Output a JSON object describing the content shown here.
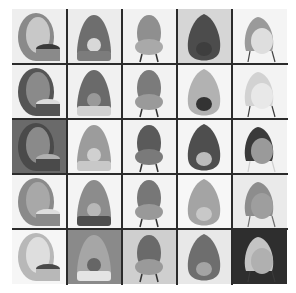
{
  "figure": {
    "type": "image-grid",
    "rows": 5,
    "cols": 5,
    "cells": [
      {
        "row": 1,
        "col": 1,
        "label": "tall egg chair with dark seat cushion",
        "bg": "#eeeeee",
        "shell": "#8a8a8a",
        "inner": "#c8c8c8",
        "accent": "#3a3a3a"
      },
      {
        "row": 1,
        "col": 2,
        "label": "avocado chair with round pit cushion",
        "bg": "#ececec",
        "shell": "#6e6e6e",
        "inner": "#7c7c7c",
        "accent": "#d8d8d8"
      },
      {
        "row": 1,
        "col": 3,
        "label": "bulbous chair with round seat on legs",
        "bg": "#f2f2f2",
        "shell": "#8f8f8f",
        "inner": "#a9a9a9",
        "accent": "#c4c4c4"
      },
      {
        "row": 1,
        "col": 4,
        "label": "dark teardrop chair with pit",
        "bg": "#d6d6d6",
        "shell": "#4c4c4c",
        "inner": "#5e5e5e",
        "accent": "#3e3e3e"
      },
      {
        "row": 1,
        "col": 5,
        "label": "pear chair with light cushion on metal legs",
        "bg": "#f4f4f4",
        "shell": "#9a9a9a",
        "inner": "#dedede",
        "accent": "#444444"
      },
      {
        "row": 2,
        "col": 1,
        "label": "ring pod chair on swivel base",
        "bg": "#f0f0f0",
        "shell": "#555555",
        "inner": "#8a8a8a",
        "accent": "#dcdcdc"
      },
      {
        "row": 2,
        "col": 2,
        "label": "reclined lounge pod, side view",
        "bg": "#f1f1f1",
        "shell": "#6a6a6a",
        "inner": "#d0d0d0",
        "accent": "#999999"
      },
      {
        "row": 2,
        "col": 3,
        "label": "avocado chair with oval seat",
        "bg": "#f2f2f2",
        "shell": "#7b7b7b",
        "inner": "#9a9a9a",
        "accent": "#e0e0e0"
      },
      {
        "row": 2,
        "col": 4,
        "label": "small avocado chair on casters",
        "bg": "#f5f5f5",
        "shell": "#b2b2b2",
        "inner": "#8c8c8c",
        "accent": "#333333"
      },
      {
        "row": 2,
        "col": 5,
        "label": "outlined pear chair with square cushion",
        "bg": "#f3f3f3",
        "shell": "#d2d2d2",
        "inner": "#e8e8e8",
        "accent": "#3a3a3a"
      },
      {
        "row": 3,
        "col": 1,
        "label": "lounge chair in living room scene",
        "bg": "#6a6a6a",
        "shell": "#4a4a4a",
        "inner": "#8a8a8a",
        "accent": "#b0b0b0"
      },
      {
        "row": 3,
        "col": 2,
        "label": "tilted egg bowl chair on pedestal",
        "bg": "#f5f5f5",
        "shell": "#9c9c9c",
        "inner": "#c8c8c8",
        "accent": "#d0d0d0"
      },
      {
        "row": 3,
        "col": 3,
        "label": "dark pointed egg chair",
        "bg": "#f2f2f2",
        "shell": "#5a5a5a",
        "inner": "#7a7a7a",
        "accent": "#a0a0a0"
      },
      {
        "row": 3,
        "col": 4,
        "label": "reclined pod with white cushion",
        "bg": "#f5f5f5",
        "shell": "#4e4e4e",
        "inner": "#e6e6e6",
        "accent": "#bcbcbc"
      },
      {
        "row": 3,
        "col": 5,
        "label": "black bowl chair with fruit seat",
        "bg": "#f2f2f2",
        "shell": "#3a3a3a",
        "inner": "#9a9a9a",
        "accent": "#cfcfcf"
      },
      {
        "row": 4,
        "col": 1,
        "label": "scoop egg chair on disc base",
        "bg": "#f3f3f3",
        "shell": "#8a8a8a",
        "inner": "#a8a8a8",
        "accent": "#dedede"
      },
      {
        "row": 4,
        "col": 2,
        "label": "pointed pod chair with dark interior",
        "bg": "#f4f4f4",
        "shell": "#8c8c8c",
        "inner": "#4e4e4e",
        "accent": "#b8b8b8"
      },
      {
        "row": 4,
        "col": 3,
        "label": "avocado chair, side view",
        "bg": "#f3f3f3",
        "shell": "#777777",
        "inner": "#999999",
        "accent": "#444444"
      },
      {
        "row": 4,
        "col": 4,
        "label": "smooth tilted avocado shell",
        "bg": "#f7f7f7",
        "shell": "#a4a4a4",
        "inner": "#b4b4b4",
        "accent": "#c8c8c8"
      },
      {
        "row": 4,
        "col": 5,
        "label": "upright egg chair with pit",
        "bg": "#eaeaea",
        "shell": "#8d8d8d",
        "inner": "#9e9e9e",
        "accent": "#6e6e6e"
      },
      {
        "row": 5,
        "col": 1,
        "label": "low curved lounge shell",
        "bg": "#f6f6f6",
        "shell": "#b8b8b8",
        "inner": "#dedede",
        "accent": "#4a4a4a"
      },
      {
        "row": 5,
        "col": 2,
        "label": "top-down round seat in room",
        "bg": "#8a8a8a",
        "shell": "#a6a6a6",
        "inner": "#e4e4e4",
        "accent": "#666666"
      },
      {
        "row": 5,
        "col": 3,
        "label": "avocado chair in room corner",
        "bg": "#cfcfcf",
        "shell": "#6a6a6a",
        "inner": "#9a9a9a",
        "accent": "#e4e4e4"
      },
      {
        "row": 5,
        "col": 4,
        "label": "split-lobe textured chair",
        "bg": "#e8e8e8",
        "shell": "#6e6e6e",
        "inner": "#8c8c8c",
        "accent": "#a4a4a4"
      },
      {
        "row": 5,
        "col": 5,
        "label": "light pear chair on dark background",
        "bg": "#2e2e2e",
        "shell": "#c4c4c4",
        "inner": "#b0b0b0",
        "accent": "#3a3a3a"
      }
    ],
    "line_color": "#2b2b2b",
    "background": "#ffffff"
  }
}
